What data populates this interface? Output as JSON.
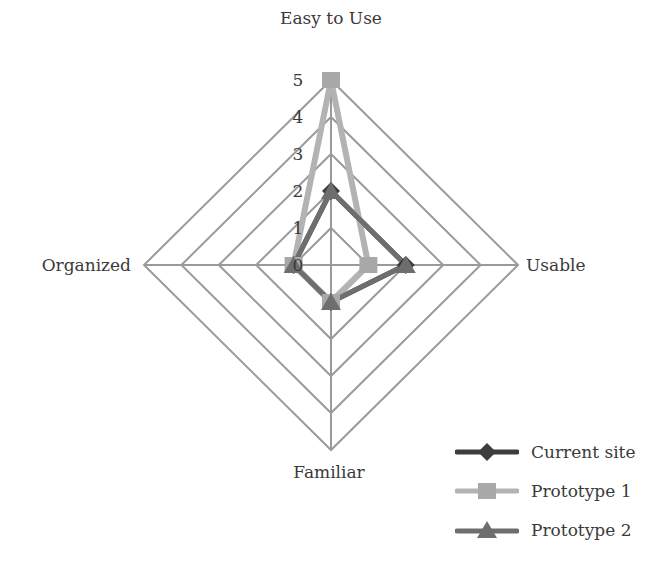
{
  "chart_data": {
    "type": "radar",
    "title": "",
    "categories": [
      "Easy to Use",
      "Usable",
      "Familiar",
      "Organized"
    ],
    "tick_labels": [
      "0",
      "1",
      "2",
      "3",
      "4",
      "5"
    ],
    "range": [
      0,
      5
    ],
    "grid": true,
    "legend_position": "bottom-right",
    "series": [
      {
        "name": "Current site",
        "marker": "diamond",
        "color": "#3d3d3d",
        "values": [
          2,
          2,
          1,
          1
        ]
      },
      {
        "name": "Prototype 1",
        "marker": "square",
        "color": "#b3b3b3",
        "values": [
          5,
          1,
          1,
          1
        ]
      },
      {
        "name": "Prototype 2",
        "marker": "triangle",
        "color": "#6e6e6e",
        "values": [
          2,
          2,
          1,
          1
        ]
      }
    ]
  },
  "colors": {
    "grid": "#9a9a9a",
    "text": "#3a3a3a",
    "background": "#ffffff"
  }
}
